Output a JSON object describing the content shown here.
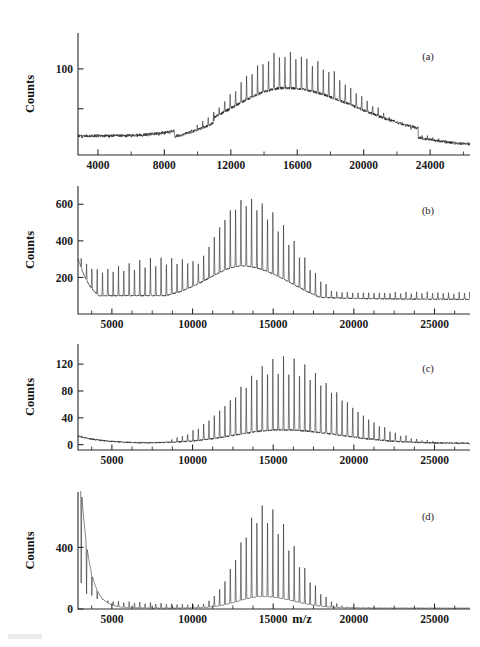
{
  "figure": {
    "background_color": "#ffffff",
    "trace_color": "#1c1c1c",
    "axis_color": "#2a2a2a",
    "x_axis_title": "m/z",
    "y_axis_title": "Counts"
  },
  "chart_data": [
    {
      "type": "line",
      "panel_label": "(a)",
      "title": "",
      "xlabel": "",
      "ylabel": "Counts",
      "xlim": [
        2800,
        26400
      ],
      "ylim": [
        -8,
        145
      ],
      "xticks": [
        4000,
        8000,
        12000,
        16000,
        20000,
        24000
      ],
      "xtick_labels": [
        "4000",
        "8000",
        "12000",
        "16000",
        "20000",
        "24000"
      ],
      "x_minor_step": 2000,
      "yticks": [
        50,
        100
      ],
      "ytick_labels": [
        "",
        "100"
      ],
      "grid": false,
      "legend": "none",
      "comb_spacing": 330,
      "comb_start": 3050,
      "baseline": 16,
      "envelope": {
        "shape": "gaussian-skew",
        "center": 15300,
        "width": 3150,
        "peak_spike": 122,
        "peak_broad": 60,
        "tail_width": 4200,
        "floor_start": 16,
        "floor_dip_x": 10100,
        "floor_dip": 9
      },
      "noise_amplitude": 3.5,
      "series": [
        {
          "name": "spike comb",
          "peak_value": 122,
          "peak_x": 15300
        },
        {
          "name": "broad envelope",
          "peak_value": 60,
          "peak_x": 15400
        }
      ]
    },
    {
      "type": "line",
      "panel_label": "(b)",
      "title": "",
      "xlabel": "",
      "ylabel": "Counts",
      "xlim": [
        2900,
        27200
      ],
      "ylim": [
        0,
        700
      ],
      "xticks": [
        5000,
        10000,
        15000,
        20000,
        25000
      ],
      "xtick_labels": [
        "5000",
        "10000",
        "15000",
        "20000",
        "25000"
      ],
      "x_minor_step": 1250,
      "yticks": [
        200,
        400,
        600
      ],
      "ytick_labels": [
        "200",
        "400",
        "600"
      ],
      "grid": false,
      "legend": "none",
      "comb_spacing": 330,
      "comb_start": 3100,
      "baseline": 85,
      "envelope": {
        "shape": "decay-plus-gaussian",
        "left_start": 380,
        "left_decay_width": 900,
        "left_floor": 100,
        "bump_center": 8600,
        "bump_height": 60,
        "bump_width": 2600,
        "center": 13300,
        "width": 2250,
        "peak_spike": 660,
        "peak_broad": 330,
        "tail_width": 3000,
        "tail_floor": 80
      },
      "noise_amplitude": 6,
      "series": [
        {
          "name": "spike comb",
          "peak_value": 660,
          "peak_x": 13300
        },
        {
          "name": "broad envelope",
          "peak_value": 330,
          "peak_x": 13000
        }
      ]
    },
    {
      "type": "line",
      "panel_label": "(c)",
      "title": "",
      "xlabel": "",
      "ylabel": "Counts",
      "xlim": [
        2900,
        27200
      ],
      "ylim": [
        -8,
        150
      ],
      "xticks": [
        5000,
        10000,
        15000,
        20000,
        25000
      ],
      "xtick_labels": [
        "5000",
        "10000",
        "15000",
        "20000",
        "25000"
      ],
      "x_minor_step": 1250,
      "yticks": [
        0,
        40,
        80,
        120
      ],
      "ytick_labels": [
        "0",
        "40",
        "80",
        "120"
      ],
      "grid": false,
      "legend": "none",
      "comb_spacing": 330,
      "comb_start": 3100,
      "baseline": 3,
      "envelope": {
        "shape": "gaussian",
        "center": 15500,
        "width": 2900,
        "peak_spike": 133,
        "peak_broad": 20,
        "tail_width": 3600,
        "left_hump_x": 3400,
        "left_hump": 11,
        "floor": 2
      },
      "noise_amplitude": 2.2,
      "series": [
        {
          "name": "spike comb",
          "peak_value": 133,
          "peak_x": 15400
        },
        {
          "name": "broad envelope",
          "peak_value": 20,
          "peak_x": 15600
        }
      ]
    },
    {
      "type": "line",
      "panel_label": "(d)",
      "title": "",
      "xlabel": "m/z",
      "ylabel": "Counts",
      "xlim": [
        2900,
        27200
      ],
      "ylim": [
        0,
        760
      ],
      "xticks": [
        5000,
        10000,
        15000,
        20000,
        25000
      ],
      "xtick_labels": [
        "5000",
        "10000",
        "15000",
        "20000",
        "25000"
      ],
      "x_minor_step": 1250,
      "yticks": [
        0,
        400
      ],
      "ytick_labels": [
        "0",
        "400"
      ],
      "grid": false,
      "legend": "none",
      "comb_spacing": 330,
      "comb_start": 3100,
      "baseline": 8,
      "envelope": {
        "shape": "exp-decay-plus-gaussian",
        "left_start": 1150,
        "left_decay_width": 520,
        "left_floor": 14,
        "center": 14350,
        "width": 1500,
        "peak_spike": 700,
        "peak_broad": 75,
        "tail_width": 1900,
        "floor": 6
      },
      "noise_amplitude": 2.0,
      "series": [
        {
          "name": "spike comb",
          "peak_value": 700,
          "peak_x": 14350
        },
        {
          "name": "matrix decay",
          "peak_value": 1150,
          "peak_x": 2900
        }
      ]
    }
  ]
}
